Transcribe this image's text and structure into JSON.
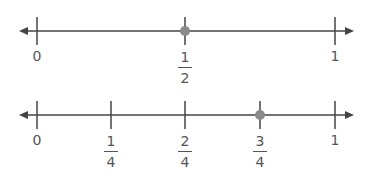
{
  "number_lines": [
    {
      "name": "halves",
      "axis_y": 31,
      "x_start": 19,
      "x_end": 354,
      "ticks": [
        {
          "x": 37,
          "value": 0,
          "label": "0",
          "type": "whole"
        },
        {
          "x": 185,
          "value": 0.5,
          "numerator": "1",
          "denominator": "2",
          "type": "fraction"
        },
        {
          "x": 335,
          "value": 1,
          "label": "1",
          "type": "whole"
        }
      ],
      "point": {
        "x": 185,
        "value": "1/2"
      }
    },
    {
      "name": "fourths",
      "axis_y": 115,
      "x_start": 19,
      "x_end": 354,
      "ticks": [
        {
          "x": 37,
          "value": 0,
          "label": "0",
          "type": "whole"
        },
        {
          "x": 111,
          "value": 0.25,
          "numerator": "1",
          "denominator": "4",
          "type": "fraction"
        },
        {
          "x": 185,
          "value": 0.5,
          "numerator": "2",
          "denominator": "4",
          "type": "fraction"
        },
        {
          "x": 260,
          "value": 0.75,
          "numerator": "3",
          "denominator": "4",
          "type": "fraction"
        },
        {
          "x": 335,
          "value": 1,
          "label": "1",
          "type": "whole"
        }
      ],
      "point": {
        "x": 260,
        "value": "3/4"
      }
    }
  ],
  "colors": {
    "line": "#444444",
    "point": "#8a8a8a",
    "text": "#555555"
  }
}
